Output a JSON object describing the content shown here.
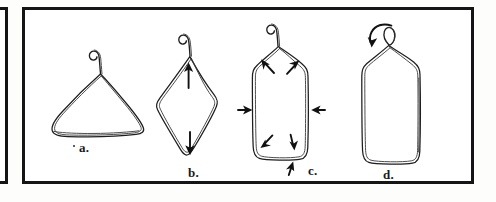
{
  "figure": {
    "kind": "hand-drawn-line-illustration",
    "ink_color": "#1a1a1a",
    "paper_color": "#ffffff",
    "panel_border_color": "#151515"
  },
  "panels": [
    {
      "name": "left-partial-panel",
      "visible_portion": "right border only"
    },
    {
      "name": "main-panel",
      "contains": "steps a through d"
    }
  ],
  "steps": [
    {
      "id": "a",
      "label": "a.",
      "shape": "triangular coat hanger, original form",
      "hook": "open hook curving up and to the left",
      "arrows": []
    },
    {
      "id": "b",
      "label": "b.",
      "shape": "diamond / rhombus, pulled vertically",
      "hook": "open hook curving up and to the left",
      "arrows": [
        {
          "name": "arrow-up-inside-b",
          "direction": "up"
        },
        {
          "name": "arrow-down-inside-b",
          "direction": "down"
        }
      ]
    },
    {
      "id": "c",
      "label": "c.",
      "shape": "tall rounded rectangle, squeezed at the sides",
      "hook": "open hook curving up and to the left",
      "arrows": [
        {
          "name": "arrow-corner-top-left",
          "direction": "up-left"
        },
        {
          "name": "arrow-corner-top-right",
          "direction": "up-right"
        },
        {
          "name": "arrow-side-left-inward",
          "direction": "right"
        },
        {
          "name": "arrow-side-right-inward",
          "direction": "left"
        },
        {
          "name": "arrow-corner-bottom-left",
          "direction": "down-left"
        },
        {
          "name": "arrow-corner-bottom-right",
          "direction": "down-right"
        },
        {
          "name": "arrow-bottom-up",
          "direction": "up"
        }
      ]
    },
    {
      "id": "d",
      "label": "d.",
      "shape": "tall rounded rectangle, finished frame",
      "hook": "hook twisted closed into a small loop",
      "arrows": [
        {
          "name": "arrow-curved-twist",
          "direction": "curved counter-clockwise down-left"
        }
      ]
    }
  ],
  "marks": {
    "stray_dot_near_a": "."
  }
}
